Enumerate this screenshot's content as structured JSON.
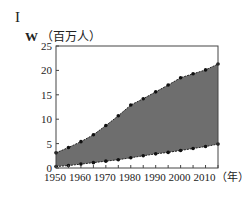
{
  "panel_label": "I",
  "title_letter": "W",
  "title_unit": "（百万人）",
  "chart_data": {
    "type": "area",
    "title": "W（百万人）",
    "xlabel": "（年）",
    "ylabel": "百万人",
    "x": [
      1950,
      1955,
      1960,
      1965,
      1970,
      1975,
      1980,
      1985,
      1990,
      1995,
      2000,
      2005,
      2010,
      2015
    ],
    "series": [
      {
        "name": "upper",
        "values": [
          3.1,
          4.2,
          5.4,
          6.8,
          8.7,
          10.7,
          12.9,
          14.2,
          15.6,
          17.0,
          18.5,
          19.3,
          20.1,
          21.3
        ]
      },
      {
        "name": "lower",
        "values": [
          0.3,
          0.5,
          0.8,
          1.1,
          1.4,
          1.7,
          2.1,
          2.5,
          2.9,
          3.2,
          3.6,
          4.0,
          4.4,
          4.9
        ]
      }
    ],
    "yticks": [
      0,
      5,
      10,
      15,
      20,
      25
    ],
    "xtick_labels": [
      "1950",
      "1960",
      "1970",
      "1980",
      "1990",
      "2000",
      "2010（年）"
    ],
    "ylim": [
      0,
      25
    ],
    "xlim": [
      1950,
      2015
    ],
    "grid": false,
    "fill_between": true,
    "fill_color": "#6e6e6e"
  }
}
